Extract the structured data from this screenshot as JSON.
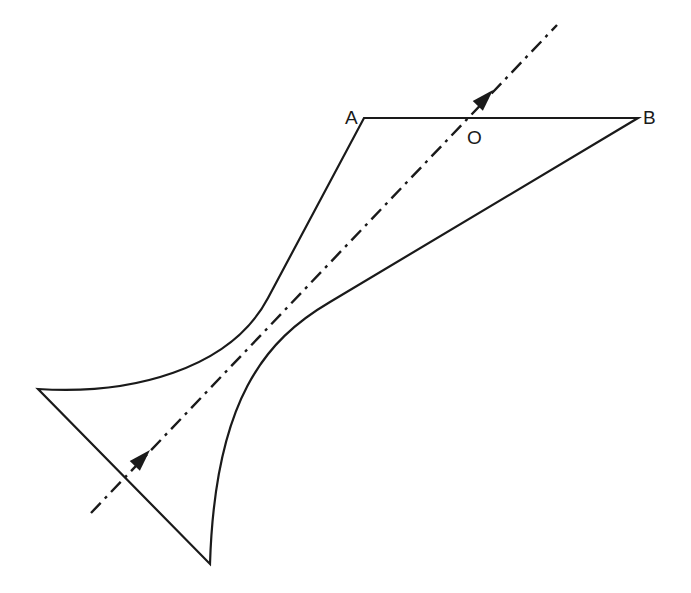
{
  "diagram": {
    "labels": {
      "A": "A",
      "B": "B",
      "O": "O"
    },
    "label_positions": {
      "A": [
        345,
        124
      ],
      "B": [
        643,
        124
      ],
      "O": [
        467,
        144
      ]
    },
    "colors": {
      "stroke": "#1a1a1a",
      "background": "#ffffff"
    },
    "shape": {
      "path": "M 364 118 L 638 118 L 330 302 C 265 340, 215 400, 210 564 L 38 389 C 130 395, 230 370, 268 298 L 364 118 Z"
    },
    "axis": {
      "start": [
        91,
        513
      ],
      "end": [
        557,
        25
      ],
      "dasharray": "14 6 3 6",
      "arrowheads": [
        {
          "tip": [
            150,
            450
          ],
          "angle_deg": -46.3
        },
        {
          "tip": [
            493,
            90
          ],
          "angle_deg": -46.3
        }
      ]
    }
  }
}
